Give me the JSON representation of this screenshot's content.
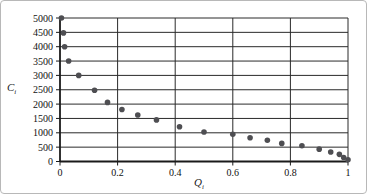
{
  "figure": {
    "background": "#ffffff",
    "border_color": "#b8b8b8"
  },
  "chart_data": {
    "type": "scatter",
    "title": "",
    "xlabel_base": "Q",
    "xlabel_sub": "i",
    "ylabel_base": "C",
    "ylabel_sub": "i",
    "xlim": [
      0,
      1
    ],
    "ylim": [
      0,
      5000
    ],
    "x_ticks": [
      0,
      0.2,
      0.4,
      0.6,
      0.8,
      1
    ],
    "x_tick_labels": [
      "0",
      "0.2",
      "0.4",
      "0.6",
      "0.8",
      "1"
    ],
    "y_ticks": [
      0,
      500,
      1000,
      1500,
      2000,
      2500,
      3000,
      3500,
      4000,
      4500,
      5000
    ],
    "y_tick_labels": [
      "0",
      "500",
      "1000",
      "1500",
      "2000",
      "2500",
      "3000",
      "3500",
      "4000",
      "4500",
      "5000"
    ],
    "grid": true,
    "legend": false,
    "marker_color": "#4e4e52",
    "grid_color": "#2a2a2a",
    "axis_color": "#1a1a1a",
    "tick_label_color": "#111111",
    "points": [
      [
        0.005,
        5000
      ],
      [
        0.012,
        4480
      ],
      [
        0.016,
        4000
      ],
      [
        0.03,
        3500
      ],
      [
        0.065,
        3000
      ],
      [
        0.12,
        2480
      ],
      [
        0.165,
        2060
      ],
      [
        0.215,
        1810
      ],
      [
        0.27,
        1620
      ],
      [
        0.335,
        1450
      ],
      [
        0.415,
        1210
      ],
      [
        0.5,
        1030
      ],
      [
        0.6,
        950
      ],
      [
        0.66,
        830
      ],
      [
        0.72,
        740
      ],
      [
        0.77,
        630
      ],
      [
        0.84,
        550
      ],
      [
        0.9,
        430
      ],
      [
        0.94,
        330
      ],
      [
        0.97,
        250
      ],
      [
        0.985,
        140
      ],
      [
        1.0,
        60
      ]
    ]
  }
}
